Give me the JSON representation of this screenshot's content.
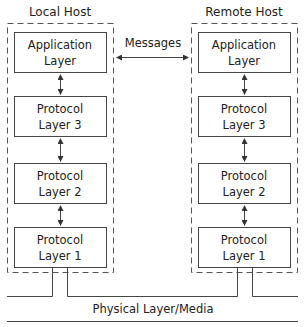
{
  "local_host": {
    "title": "Local Host",
    "layers": [
      {
        "line1": "Application",
        "line2": "Layer"
      },
      {
        "line1": "Protocol",
        "line2": "Layer 3"
      },
      {
        "line1": "Protocol",
        "line2": "Layer 2"
      },
      {
        "line1": "Protocol",
        "line2": "Layer 1"
      }
    ]
  },
  "remote_host": {
    "title": "Remote Host",
    "layers": [
      {
        "line1": "Application",
        "line2": "Layer"
      },
      {
        "line1": "Protocol",
        "line2": "Layer 3"
      },
      {
        "line1": "Protocol",
        "line2": "Layer 2"
      },
      {
        "line1": "Protocol",
        "line2": "Layer 1"
      }
    ]
  },
  "messages_label": "Messages",
  "physical_label": "Physical Layer/Media",
  "colors": {
    "stroke": "#444444",
    "text": "#222222",
    "background": "#ffffff"
  }
}
